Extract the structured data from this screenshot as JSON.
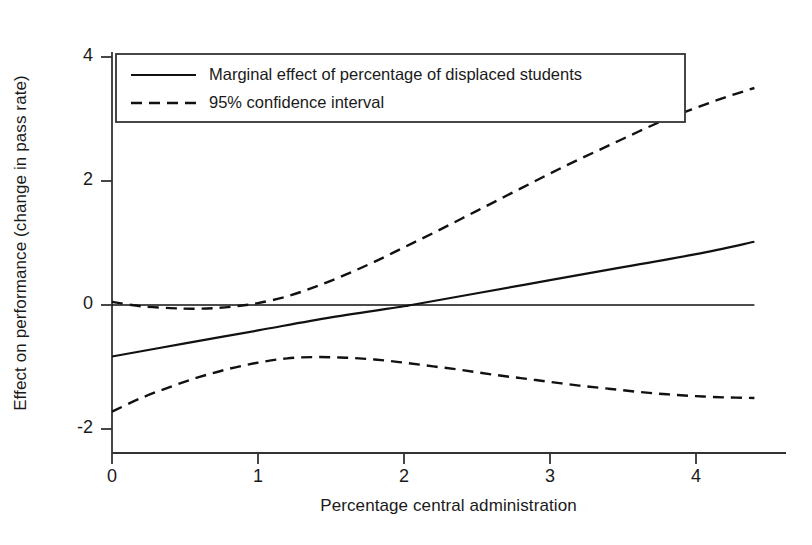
{
  "chart_data": {
    "type": "line",
    "title": "",
    "xlabel": "Percentage central administration",
    "ylabel": "Effect on performance (change in pass rate)",
    "xlim": [
      -0.07,
      4.47
    ],
    "ylim": [
      -2.4,
      4.35
    ],
    "xticks": [
      "0",
      "1",
      "2",
      "3",
      "4"
    ],
    "xtick_values": [
      0,
      1,
      2,
      3,
      4
    ],
    "yticks": [
      "4",
      "2",
      "0",
      "-2"
    ],
    "ytick_values": [
      4,
      2,
      0,
      -2
    ],
    "grid": false,
    "zero_reference_line": 0,
    "legend_position": "upper-left-inside",
    "series": [
      {
        "name": "Marginal effect of percentage of displaced students",
        "style": "solid",
        "color": "#111111",
        "x": [
          0,
          0.5,
          1,
          1.5,
          2,
          2.05,
          2.5,
          3,
          3.5,
          4,
          4.4
        ],
        "values": [
          -0.83,
          -0.62,
          -0.41,
          -0.2,
          -0.02,
          0.0,
          0.19,
          0.4,
          0.61,
          0.82,
          1.02
        ]
      },
      {
        "name": "95% confidence interval (upper)",
        "style": "dashed",
        "color": "#111111",
        "x": [
          0,
          0.2,
          0.4,
          0.55,
          0.7,
          0.85,
          1.0,
          1.2,
          1.4,
          1.6,
          1.8,
          2.0,
          2.2,
          2.4,
          2.6,
          2.8,
          3.0,
          3.2,
          3.4,
          3.6,
          3.8,
          4.0,
          4.2,
          4.4
        ],
        "values": [
          0.05,
          -0.02,
          -0.05,
          -0.06,
          -0.05,
          -0.02,
          0.03,
          0.14,
          0.3,
          0.49,
          0.7,
          0.93,
          1.16,
          1.4,
          1.64,
          1.88,
          2.12,
          2.35,
          2.57,
          2.79,
          3.0,
          3.18,
          3.35,
          3.5
        ]
      },
      {
        "name": "95% confidence interval (lower)",
        "style": "dashed",
        "color": "#111111",
        "x": [
          0,
          0.2,
          0.4,
          0.6,
          0.8,
          1.0,
          1.2,
          1.4,
          1.6,
          1.8,
          2.0,
          2.2,
          2.4,
          2.6,
          2.8,
          3.0,
          3.2,
          3.4,
          3.6,
          3.8,
          4.0,
          4.2,
          4.4
        ],
        "values": [
          -1.72,
          -1.5,
          -1.32,
          -1.16,
          -1.03,
          -0.93,
          -0.86,
          -0.84,
          -0.85,
          -0.88,
          -0.93,
          -0.99,
          -1.05,
          -1.12,
          -1.18,
          -1.24,
          -1.3,
          -1.35,
          -1.4,
          -1.44,
          -1.47,
          -1.49,
          -1.5
        ]
      }
    ],
    "legend_entries": [
      {
        "label": "Marginal effect of percentage of displaced students",
        "style": "solid"
      },
      {
        "label": "95% confidence interval",
        "style": "dashed"
      }
    ]
  },
  "axes": {
    "x_title": "Percentage central administration",
    "y_title": "Effect on performance (change in pass rate)"
  },
  "ticks": {
    "x": [
      {
        "label": "0"
      },
      {
        "label": "1"
      },
      {
        "label": "2"
      },
      {
        "label": "3"
      },
      {
        "label": "4"
      }
    ],
    "y": [
      {
        "label": "4"
      },
      {
        "label": "2"
      },
      {
        "label": "0"
      },
      {
        "label": "-2"
      }
    ]
  },
  "legend": {
    "entries": [
      {
        "label": "Marginal effect of percentage of displaced students"
      },
      {
        "label": "95% confidence interval"
      }
    ]
  },
  "colors": {
    "line": "#111111",
    "axis": "#333333",
    "background": "#ffffff"
  }
}
